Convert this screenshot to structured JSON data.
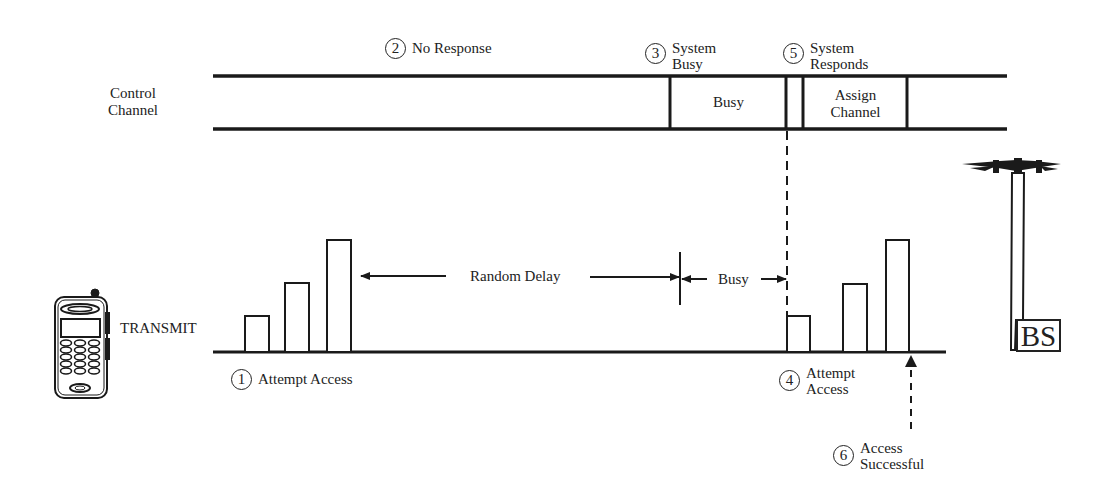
{
  "diagram": {
    "title": "",
    "control_channel": {
      "label_line1": "Control",
      "label_line2": "Channel",
      "slots": [
        {
          "label": "Busy"
        },
        {
          "label_line1": "Assign",
          "label_line2": "Channel"
        }
      ]
    },
    "transmit_label": "TRANSMIT",
    "random_delay_label": "Random Delay",
    "busy_interval_label": "Busy",
    "base_station_label": "BS",
    "steps": [
      {
        "number": "1",
        "line1": "Attempt Access",
        "line2": ""
      },
      {
        "number": "2",
        "line1": "No Response",
        "line2": ""
      },
      {
        "number": "3",
        "line1": "System",
        "line2": "Busy"
      },
      {
        "number": "4",
        "line1": "Attempt",
        "line2": "Access"
      },
      {
        "number": "5",
        "line1": "System",
        "line2": "Responds"
      },
      {
        "number": "6",
        "line1": "Access",
        "line2": "Successful"
      }
    ],
    "access_attempt_bursts": {
      "first_attempt_relative_heights": [
        1,
        2,
        3
      ],
      "second_attempt_relative_heights": [
        1,
        2,
        3
      ]
    },
    "colors": {
      "ink": "#1a1a1a",
      "background": "#ffffff"
    }
  }
}
